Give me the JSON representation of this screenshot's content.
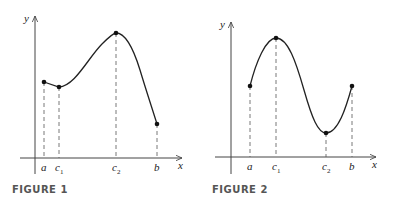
{
  "figures": [
    {
      "caption": "FIGURE 1",
      "axes": {
        "x": "x",
        "y": "y"
      },
      "tick_labels": [
        {
          "main": "a",
          "sub": ""
        },
        {
          "main": "c",
          "sub": "1"
        },
        {
          "main": "c",
          "sub": "2"
        },
        {
          "main": "b",
          "sub": ""
        }
      ],
      "points": [
        "(a, f(a))",
        "(c1, f(c1)) local min",
        "(c2, f(c2)) absolute max",
        "(b, f(b)) absolute min"
      ]
    },
    {
      "caption": "FIGURE 2",
      "axes": {
        "x": "x",
        "y": "y"
      },
      "tick_labels": [
        {
          "main": "a",
          "sub": ""
        },
        {
          "main": "c",
          "sub": "1"
        },
        {
          "main": "c",
          "sub": "2"
        },
        {
          "main": "b",
          "sub": ""
        }
      ],
      "points": [
        "(a, f(a))",
        "(c1, f(c1)) absolute max",
        "(c2, f(c2)) absolute min",
        "(b, f(b))"
      ]
    }
  ],
  "colors": {
    "curve": "#222222",
    "axis": "#444444",
    "caption": "#555555"
  }
}
